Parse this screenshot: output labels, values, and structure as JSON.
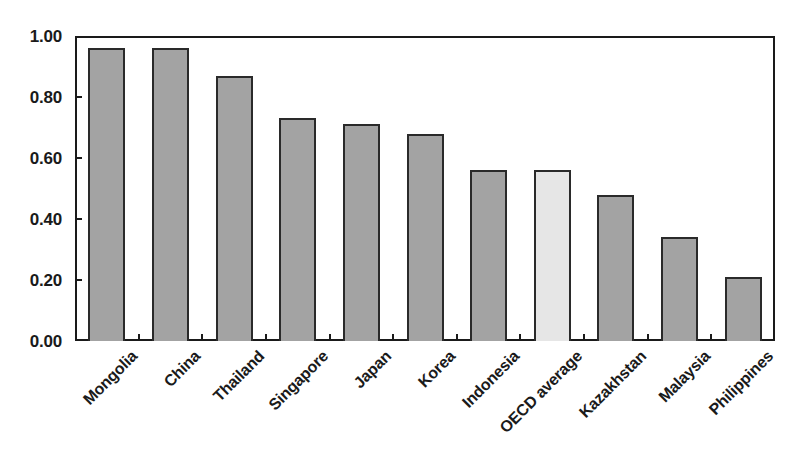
{
  "chart_data": {
    "type": "bar",
    "title": "",
    "subtitle": "",
    "xlabel": "",
    "ylabel": "",
    "ylim": [
      0.0,
      1.0
    ],
    "grid": false,
    "legend": "none",
    "categories": [
      "Mongolia",
      "China",
      "Thailand",
      "Singapore",
      "Japan",
      "Korea",
      "Indonesia",
      "OECD average",
      "Kazakhstan",
      "Malaysia",
      "Philippines"
    ],
    "values": [
      0.96,
      0.96,
      0.87,
      0.73,
      0.71,
      0.68,
      0.56,
      0.56,
      0.48,
      0.34,
      0.21
    ],
    "ytick_labels": [
      "0.00",
      "0.20",
      "0.40",
      "0.60",
      "0.80",
      "1.00"
    ],
    "ytick_values": [
      0.0,
      0.2,
      0.4,
      0.6,
      0.8,
      1.0
    ],
    "highlight_category": "OECD average",
    "colors": {
      "bar_fill": "#a3a3a3",
      "highlight_fill": "#e6e6e6",
      "bar_border": "#2a2a2a",
      "axis": "#1a1a1a",
      "background": "#ffffff",
      "text": "#1a1a1a"
    }
  }
}
